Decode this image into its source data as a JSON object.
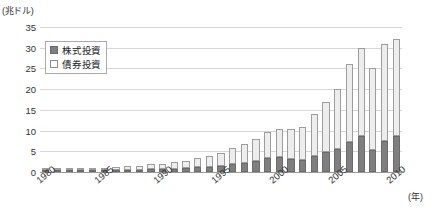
{
  "chart_data": {
    "type": "bar",
    "stacked": true,
    "title": "",
    "xlabel": "(年)",
    "ylabel": "(兆ドル)",
    "ylim": [
      0,
      35
    ],
    "ytick_step": 5,
    "yticks": [
      "35",
      "30",
      "25",
      "20",
      "15",
      "10",
      "5",
      "0"
    ],
    "grid": true,
    "legend_position": "top-left",
    "categories": [
      "1980",
      "1981",
      "1982",
      "1983",
      "1984",
      "1985",
      "1986",
      "1987",
      "1988",
      "1989",
      "1990",
      "1991",
      "1992",
      "1993",
      "1994",
      "1995",
      "1996",
      "1997",
      "1998",
      "1999",
      "2000",
      "2001",
      "2002",
      "2003",
      "2004",
      "2005",
      "2006",
      "2007",
      "2008",
      "2009",
      "2010"
    ],
    "xtick_labels": [
      "1980",
      "1985",
      "1990",
      "1995",
      "2000",
      "2005",
      "2010"
    ],
    "series": [
      {
        "name": "株式投資",
        "color": "#7f7f7f",
        "values": [
          0.12,
          0.14,
          0.16,
          0.22,
          0.24,
          0.32,
          0.45,
          0.5,
          0.52,
          0.65,
          0.62,
          0.78,
          0.85,
          1.1,
          1.15,
          1.5,
          1.85,
          2.2,
          2.6,
          3.4,
          3.6,
          3.2,
          2.8,
          3.9,
          4.8,
          5.6,
          7.2,
          8.8,
          5.3,
          7.6,
          8.8
        ]
      },
      {
        "name": "債券投資",
        "color": "#ededed",
        "values": [
          0.18,
          0.22,
          0.26,
          0.32,
          0.4,
          0.55,
          0.75,
          0.9,
          1.0,
          1.25,
          1.35,
          1.6,
          1.9,
          2.4,
          2.6,
          3.2,
          3.9,
          4.6,
          5.4,
          6.3,
          6.8,
          7.3,
          8.1,
          10.1,
          12.2,
          14.4,
          18.8,
          21.2,
          19.7,
          23.4,
          23.2
        ]
      }
    ],
    "totals": [
      0.3,
      0.36,
      0.42,
      0.54,
      0.64,
      0.87,
      1.2,
      1.4,
      1.52,
      1.9,
      1.97,
      2.38,
      2.75,
      3.5,
      3.75,
      4.7,
      5.75,
      6.8,
      8.0,
      9.7,
      10.4,
      10.5,
      10.9,
      14.0,
      17.0,
      20.0,
      26.0,
      30.0,
      25.0,
      31.0,
      32.0
    ]
  },
  "legend": {
    "items": [
      {
        "label": "株式投資"
      },
      {
        "label": "債券投資"
      }
    ]
  }
}
